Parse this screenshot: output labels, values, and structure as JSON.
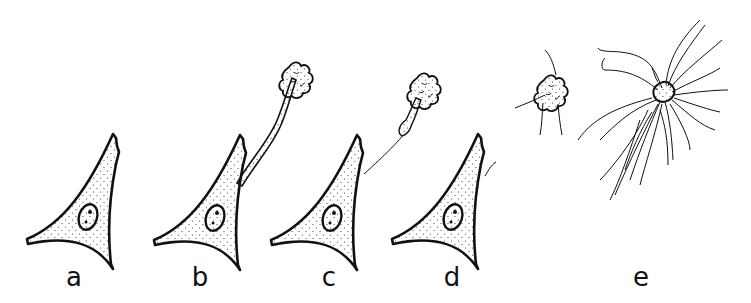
{
  "figure": {
    "panels": [
      {
        "id": "a",
        "label": "a",
        "content": "intact triangular cell with stippled cytoplasm and nucleus with two nucleoli"
      },
      {
        "id": "b",
        "label": "b",
        "content": "cell with thick stalk extending to a lobed cluster"
      },
      {
        "id": "c",
        "label": "c",
        "content": "cell with thin thread connecting to a detached lobed cluster with tapered stalk"
      },
      {
        "id": "d",
        "label": "d",
        "content": "cell with small residual filament"
      },
      {
        "id": "e",
        "label": "e",
        "content": "free lobed clusters, one with many long radiating filaments"
      }
    ],
    "colors": {
      "ink": "#111111",
      "background": "#ffffff"
    }
  }
}
